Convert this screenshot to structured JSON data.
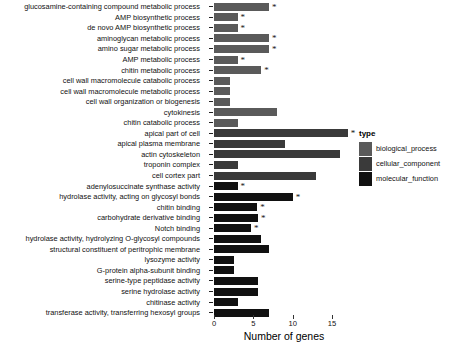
{
  "chart_data": {
    "type": "bar",
    "orientation": "horizontal",
    "title": "",
    "xlabel": "Number of genes",
    "ylabel": "",
    "xlim": [
      0,
      18
    ],
    "xticks": [
      0,
      5,
      10,
      15
    ],
    "xticklabels": [
      "0",
      "5",
      "10",
      "15"
    ],
    "grid": false,
    "legend": {
      "title": "type",
      "position": "right",
      "entries": [
        {
          "label": "biological_process",
          "color": "#5a5a5a"
        },
        {
          "label": "cellular_component",
          "color": "#3a3a3a"
        },
        {
          "label": "molecular_function",
          "color": "#111111"
        }
      ]
    },
    "categories": [
      "glucosamine-containing compound metabolic process",
      "AMP biosynthetic process",
      "de novo AMP biosynthetic process",
      "aminoglycan metabolic process",
      "amino sugar metabolic process",
      "AMP metabolic process",
      "chitin metabolic process",
      "cell wall macromolecule catabolic process",
      "cell wall macromolecule metabolic process",
      "cell wall organization or biogenesis",
      "cytokinesis",
      "chitin catabolic process",
      "apical part of cell",
      "apical plasma membrane",
      "actin cytoskeleton",
      "troponin complex",
      "cell cortex part",
      "adenylosuccinate synthase activity",
      "hydrolase activity, acting on glycosyl bonds",
      "chitin binding",
      "carbohydrate derivative binding",
      "Notch binding",
      "hydrolase activity, hydrolyzing O-glycosyl compounds",
      "structural constituent of peritrophic membrane",
      "lysozyme activity",
      "G-protein alpha-subunit binding",
      "serine-type peptidase activity",
      "serine hydrolase activity",
      "chitinase activity",
      "transferase activity, transferring hexosyl groups"
    ],
    "values": [
      7,
      3,
      3,
      7,
      7,
      3,
      6,
      2,
      2,
      2,
      8,
      3,
      17,
      9,
      16,
      3,
      13,
      3,
      10,
      5.5,
      5.6,
      4.7,
      6,
      7,
      2.5,
      2.5,
      5.6,
      5.6,
      3,
      7
    ],
    "types": [
      "biological_process",
      "biological_process",
      "biological_process",
      "biological_process",
      "biological_process",
      "biological_process",
      "biological_process",
      "biological_process",
      "biological_process",
      "biological_process",
      "biological_process",
      "biological_process",
      "cellular_component",
      "cellular_component",
      "cellular_component",
      "cellular_component",
      "cellular_component",
      "molecular_function",
      "molecular_function",
      "molecular_function",
      "molecular_function",
      "molecular_function",
      "molecular_function",
      "molecular_function",
      "molecular_function",
      "molecular_function",
      "molecular_function",
      "molecular_function",
      "molecular_function",
      "molecular_function"
    ],
    "significance_marker": "*",
    "significant": [
      true,
      true,
      true,
      true,
      true,
      true,
      true,
      false,
      false,
      false,
      false,
      false,
      true,
      false,
      false,
      false,
      false,
      true,
      true,
      true,
      true,
      true,
      false,
      false,
      false,
      false,
      false,
      false,
      false,
      false
    ]
  }
}
